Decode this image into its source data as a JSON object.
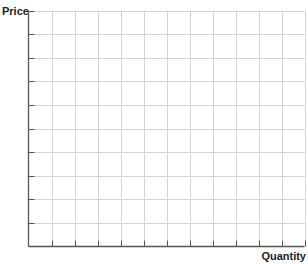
{
  "chart_data": {
    "type": "line",
    "title": "",
    "xlabel": "Quantity",
    "ylabel": "Price",
    "series": [],
    "x_ticks": 12,
    "y_ticks": 10,
    "x_tick_labels": [],
    "y_tick_labels": [],
    "grid": true,
    "legend": null
  },
  "labels": {
    "y_axis": "Price",
    "x_axis": "Quantity"
  },
  "colors": {
    "axis": "#555555",
    "grid": "#d4d4d4",
    "text": "#222222"
  }
}
